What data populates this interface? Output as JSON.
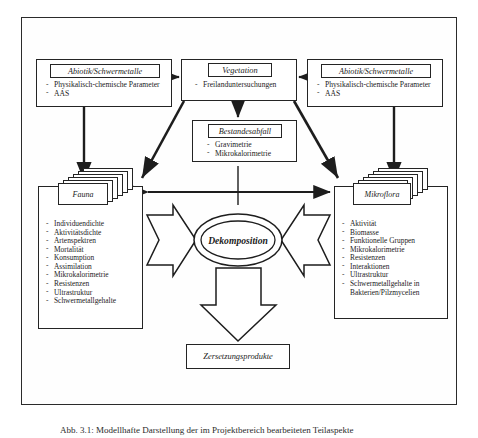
{
  "figure": {
    "caption": "Abb. 3.1: Modellhafte Darstellung der im Projektbereich bearbeiteten Teilaspekte"
  },
  "boxes": {
    "abiotik_left": {
      "title": "Abiotik/Schwermetalle",
      "items": [
        "Physikalisch-chemische Parameter",
        "AAS"
      ]
    },
    "abiotik_right": {
      "title": "Abiotik/Schwermetalle",
      "items": [
        "Physikalisch-chemische Parameter",
        "AAS"
      ]
    },
    "vegetation": {
      "title": "Vegetation",
      "items": [
        "Freilanduntersuchungen"
      ]
    },
    "bestandesabfall": {
      "title": "Bestandesabfall",
      "items": [
        "Gravimetrie",
        "Mikrokalorimetrie"
      ]
    },
    "fauna": {
      "title": "Fauna",
      "items": [
        "Individuendichte",
        "Aktivitätsdichte",
        "Artenspektren",
        "Mortalität",
        "Konsumption",
        "Assimilation",
        "Mikrokalorimetrie",
        "Resistenzen",
        "Ultrastruktur",
        "Schwermetallgehalte"
      ]
    },
    "mikroflora": {
      "title": "Mikroflora",
      "items": [
        "Aktivität",
        "Biomasse",
        "Funktionelle Gruppen",
        "Mikrokalorimetrie",
        "Resistenzen",
        "Interaktionen",
        "Ultrastruktur",
        "Schwermetallgehalte in"
      ],
      "last_item_continuation": "Bakterien/Pilzmycelien"
    },
    "dekomposition": {
      "title": "Dekomposition"
    },
    "zersetzungsprodukte": {
      "title": "Zersetzungsprodukte"
    }
  },
  "colors": {
    "ink": "#242424",
    "paper": "#ffffff",
    "frame": "#2b2b2b"
  }
}
